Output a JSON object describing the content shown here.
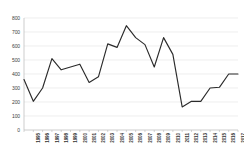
{
  "chart_data": {
    "type": "line",
    "title": "",
    "subtitle": "",
    "xlabel": "",
    "ylabel": "",
    "categories": [
      "1995",
      "1996",
      "1997",
      "1998",
      "1999",
      "2000",
      "2001",
      "2002",
      "2003",
      "2004",
      "2005",
      "2006",
      "2007",
      "2008",
      "2009",
      "2010",
      "2011",
      "2012",
      "2013",
      "2014",
      "2015",
      "2016",
      "2017",
      "2018"
    ],
    "values": [
      360,
      205,
      300,
      510,
      430,
      450,
      470,
      340,
      380,
      615,
      590,
      745,
      660,
      610,
      450,
      660,
      540,
      165,
      205,
      205,
      300,
      305,
      400,
      400
    ],
    "series": [
      {
        "name": "series-1",
        "values": [
          360,
          205,
          300,
          510,
          430,
          450,
          470,
          340,
          380,
          615,
          590,
          745,
          660,
          610,
          450,
          660,
          540,
          165,
          205,
          205,
          300,
          305,
          400,
          400
        ]
      }
    ],
    "ylim": [
      0,
      800
    ],
    "yticks": [
      0,
      100,
      200,
      300,
      400,
      500,
      600,
      700,
      800
    ],
    "ytick_labels": [
      "0",
      "100",
      "200",
      "300",
      "400",
      "500",
      "600",
      "700",
      "800"
    ],
    "grid": "horizontal",
    "legend": "none",
    "line_color": "#2b2b2b",
    "grid_color": "#e2e2e2",
    "axis_color": "#b8b8b8",
    "background_color": "#ffffff"
  }
}
